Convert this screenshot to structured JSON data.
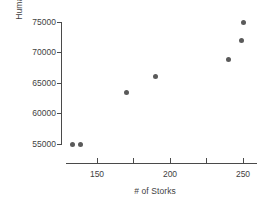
{
  "chart_data": {
    "type": "scatter",
    "title": "",
    "xlabel": "# of Storks",
    "ylabel": "Human Population",
    "xlim": [
      128,
      258
    ],
    "ylim": [
      53200,
      76500
    ],
    "grid": false,
    "legend": "none",
    "marker_color": "#5a5a5a",
    "axis_color": "#4a4a4a",
    "x_ticks": [
      150,
      175,
      200,
      225,
      250
    ],
    "x_tick_labels": [
      "150",
      "",
      "200",
      "",
      "250"
    ],
    "y_ticks": [
      55000,
      60000,
      65000,
      70000,
      75000
    ],
    "y_tick_labels": [
      "55000",
      "60000",
      "65000",
      "70000",
      "75000"
    ],
    "points": [
      {
        "x": 133,
        "y": 55000
      },
      {
        "x": 139,
        "y": 55000
      },
      {
        "x": 170,
        "y": 63500
      },
      {
        "x": 190,
        "y": 66000
      },
      {
        "x": 240,
        "y": 68800
      },
      {
        "x": 249,
        "y": 71900
      },
      {
        "x": 250,
        "y": 75000
      }
    ]
  }
}
